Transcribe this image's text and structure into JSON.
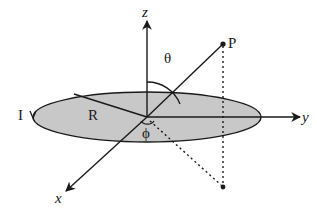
{
  "figure": {
    "labels": {
      "z_axis": "z",
      "y_axis": "y",
      "x_axis": "x",
      "point": "P",
      "theta": "θ",
      "phi": "ϕ",
      "radius": "R",
      "current": "I"
    },
    "colors": {
      "loop_fill": "#c8c8c8",
      "stroke": "#1a1a1a",
      "background": "#ffffff"
    }
  }
}
